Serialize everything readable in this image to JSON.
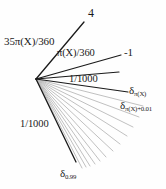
{
  "figure": {
    "type": "ray-fan-diagram",
    "background_color": "#fefefe",
    "ink_color": "#1a1a1a",
    "faint_ray_color": "#b9b9b9",
    "vertex": {
      "x": 36,
      "y": 79
    }
  },
  "labels": {
    "top_value": "4",
    "left_angle": "35π(X)/360",
    "mid_angle": "π(X)/360",
    "right_value": "-1",
    "upper_gap": "1/1000",
    "lower_gap": "1/1000",
    "delta_pi": {
      "base": "δ",
      "sub": "π(X)"
    },
    "delta_pi_offset": {
      "base": "δ",
      "sub": "π(X)+0.01"
    },
    "delta_099": {
      "base": "δ",
      "sub": "0.99"
    }
  },
  "rays": {
    "dark": [
      {
        "name": "ray-to-4",
        "x2": 84,
        "y2": 22,
        "width": 1.3
      },
      {
        "name": "ray-to-minus-1",
        "x2": 121,
        "y2": 55,
        "width": 1.2
      },
      {
        "name": "ray-upper-gap",
        "x2": 119,
        "y2": 72,
        "width": 1.2
      },
      {
        "name": "ray-to-delta-pi",
        "x2": 128,
        "y2": 92,
        "width": 1.2
      },
      {
        "name": "ray-to-delta-099",
        "x2": 76,
        "y2": 162,
        "width": 1.3
      }
    ],
    "faint": [
      {
        "name": "faint-ray-1",
        "x2": 143,
        "y2": 106
      },
      {
        "name": "faint-ray-2",
        "x2": 139,
        "y2": 117
      },
      {
        "name": "faint-ray-3",
        "x2": 133,
        "y2": 127
      },
      {
        "name": "faint-ray-4",
        "x2": 127,
        "y2": 136
      },
      {
        "name": "faint-ray-5",
        "x2": 120,
        "y2": 144
      },
      {
        "name": "faint-ray-6",
        "x2": 113,
        "y2": 151
      },
      {
        "name": "faint-ray-7",
        "x2": 106,
        "y2": 157
      },
      {
        "name": "faint-ray-8",
        "x2": 100,
        "y2": 161
      },
      {
        "name": "faint-ray-9",
        "x2": 95,
        "y2": 164
      },
      {
        "name": "faint-ray-10",
        "x2": 90,
        "y2": 166
      },
      {
        "name": "faint-ray-11",
        "x2": 86,
        "y2": 167
      },
      {
        "name": "faint-ray-12",
        "x2": 82,
        "y2": 168
      }
    ]
  }
}
